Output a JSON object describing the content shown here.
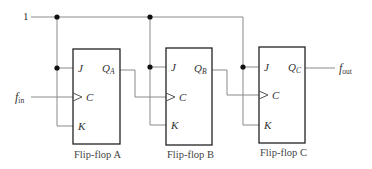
{
  "diagram": {
    "type": "circuit",
    "input_high_label": "1",
    "clock_input": {
      "main": "f",
      "sub": "in"
    },
    "output": {
      "main": "f",
      "sub": "out"
    },
    "flip_flops": [
      {
        "id": "A",
        "caption": "Flip-flop A",
        "pins": {
          "j": "J",
          "c": "C",
          "k": "K"
        },
        "q": {
          "main": "Q",
          "sub": "A"
        }
      },
      {
        "id": "B",
        "caption": "Flip-flop B",
        "pins": {
          "j": "J",
          "c": "C",
          "k": "K"
        },
        "q": {
          "main": "Q",
          "sub": "B"
        }
      },
      {
        "id": "C",
        "caption": "Flip-flop C",
        "pins": {
          "j": "J",
          "c": "C",
          "k": "K"
        },
        "q": {
          "main": "Q",
          "sub": "C"
        }
      }
    ],
    "connections": [
      "1 -> J,K of Flip-flop A",
      "1 -> J,K of Flip-flop B",
      "1 -> J,K of Flip-flop C",
      "f_in -> C of Flip-flop A",
      "Q_A -> C of Flip-flop B",
      "Q_B -> C of Flip-flop C",
      "Q_C -> f_out"
    ]
  }
}
